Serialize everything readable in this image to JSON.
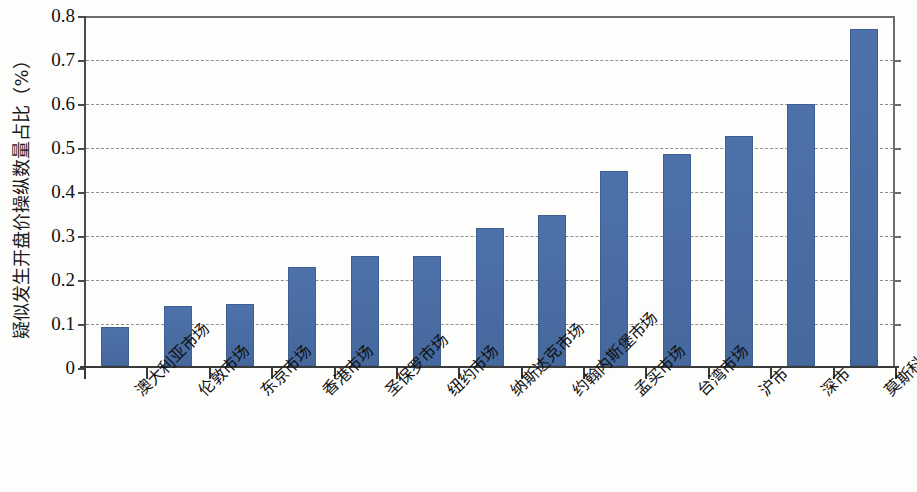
{
  "chart_data": {
    "type": "bar",
    "title": "",
    "subtitle": "",
    "xlabel": "",
    "ylabel": "疑似发生开盘价操纵数量占比（%）",
    "ylim": [
      0,
      0.8
    ],
    "ytick_labels": [
      "0.8",
      "0.7",
      "0.6",
      "0.5",
      "0.4",
      "0.3",
      "0.2",
      "0.1",
      "0"
    ],
    "ytick_values": [
      0.8,
      0.7,
      0.6,
      0.5,
      0.4,
      0.3,
      0.2,
      0.1,
      0
    ],
    "grid": true,
    "grid_style": "dashed",
    "legend": false,
    "legend_position": "none",
    "bar_color": "#4a6ea5",
    "categories": [
      "澳大利亚市场",
      "伦敦市场",
      "东京市场",
      "香港市场",
      "圣保罗市场",
      "纽约市场",
      "纳斯达克市场",
      "约翰内斯堡市场",
      "孟买市场",
      "台湾市场",
      "沪市",
      "深市",
      "莫斯科市场"
    ],
    "values": [
      0.088,
      0.136,
      0.141,
      0.226,
      0.249,
      0.251,
      0.314,
      0.343,
      0.443,
      0.481,
      0.523,
      0.595,
      0.765
    ]
  }
}
